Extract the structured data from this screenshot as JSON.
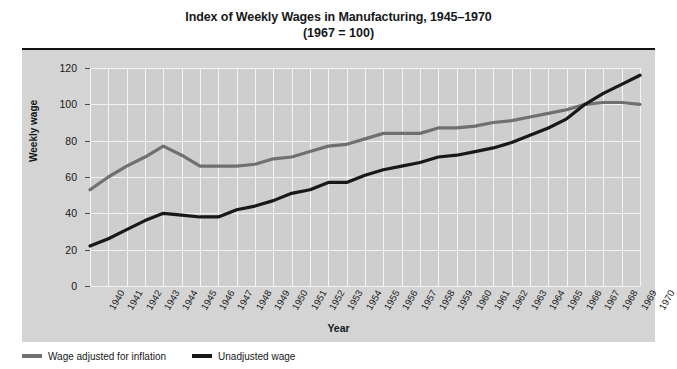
{
  "chart_data": {
    "type": "line",
    "title": "Index of Weekly Wages in Manufacturing, 1945–1970",
    "subtitle": "(1967 = 100)",
    "xlabel": "Year",
    "ylabel": "Weekly wage",
    "ylim": [
      0,
      120
    ],
    "yticks": [
      0,
      20,
      40,
      60,
      80,
      100,
      120
    ],
    "grid": true,
    "legend_position": "below-plot-left",
    "categories": [
      "1940",
      "1941",
      "1942",
      "1943",
      "1944",
      "1945",
      "1946",
      "1947",
      "1948",
      "1949",
      "1950",
      "1951",
      "1952",
      "1953",
      "1954",
      "1955",
      "1956",
      "1957",
      "1958",
      "1959",
      "1960",
      "1961",
      "1962",
      "1963",
      "1964",
      "1965",
      "1966",
      "1967",
      "1968",
      "1969",
      "1970"
    ],
    "series": [
      {
        "name": "Wage adjusted for inflation",
        "color": "#6e7071",
        "values": [
          53,
          60,
          66,
          71,
          77,
          72,
          66,
          66,
          66,
          67,
          70,
          71,
          74,
          77,
          78,
          81,
          84,
          84,
          84,
          87,
          87,
          88,
          90,
          91,
          93,
          95,
          97,
          100,
          101,
          101,
          100
        ]
      },
      {
        "name": "Unadjusted wage",
        "color": "#16181a",
        "values": [
          22,
          26,
          31,
          36,
          40,
          39,
          38,
          38,
          42,
          44,
          47,
          51,
          53,
          57,
          57,
          61,
          64,
          66,
          68,
          71,
          72,
          74,
          76,
          79,
          83,
          87,
          92,
          100,
          106,
          111,
          116
        ]
      }
    ]
  },
  "legend": [
    {
      "label": "Wage adjusted for inflation",
      "color": "#6e7071"
    },
    {
      "label": "Unadjusted wage",
      "color": "#16181a"
    }
  ]
}
